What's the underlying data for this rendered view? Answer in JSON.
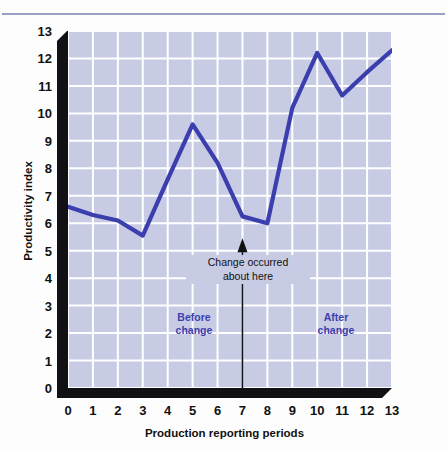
{
  "chart_data": {
    "type": "line",
    "title": "",
    "xlabel": "Production reporting periods",
    "ylabel": "Productivity index",
    "xlim": [
      0,
      13
    ],
    "ylim": [
      0,
      13
    ],
    "grid": true,
    "legend_position": "none",
    "x": [
      0,
      1,
      2,
      3,
      4,
      5,
      6,
      7,
      8,
      9,
      10,
      11,
      12,
      13
    ],
    "values": [
      6.6,
      6.3,
      6.1,
      5.55,
      7.6,
      9.6,
      8.2,
      6.25,
      6.0,
      10.2,
      12.2,
      10.65,
      11.5,
      12.3
    ],
    "series": [
      {
        "name": "Productivity index",
        "color": "#3b3fae",
        "values": [
          6.6,
          6.3,
          6.1,
          5.55,
          7.6,
          9.6,
          8.2,
          6.25,
          6.0,
          10.2,
          12.2,
          10.65,
          11.5,
          12.3
        ]
      }
    ],
    "xticks": [
      "0",
      "1",
      "2",
      "3",
      "4",
      "5",
      "6",
      "7",
      "8",
      "9",
      "10",
      "11",
      "12",
      "13"
    ],
    "yticks": [
      "0",
      "1",
      "2",
      "3",
      "4",
      "5",
      "6",
      "7",
      "8",
      "9",
      "10",
      "11",
      "12",
      "13"
    ],
    "annotations": [
      {
        "name": "change-arrow",
        "text": "Change occurred\nabout here",
        "x": 7,
        "y_from": 0,
        "y_to": 5.45,
        "type": "arrow-up"
      },
      {
        "name": "before-change-label",
        "text": "Before\nchange",
        "x": 3.2,
        "y": 1.25,
        "color": "#3b3fae"
      },
      {
        "name": "after-change-label",
        "text": "After\nchange",
        "x": 9.9,
        "y": 1.25,
        "color": "#3b3fae"
      }
    ],
    "colors": {
      "plot_background": "#c8cbe4",
      "gridline": "#ffffff",
      "line": "#3b3fae",
      "axis_shadow": "#111014",
      "top_rule": "#9aa0c4",
      "tick_text": "#111111"
    }
  }
}
